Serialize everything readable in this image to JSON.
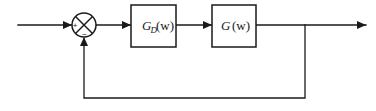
{
  "figure": {
    "type": "control-system-block-diagram",
    "width": 376,
    "height": 111,
    "background_color": "#ffffff",
    "line_color": "#1a1a1a"
  },
  "blocks": [
    {
      "id": "controller",
      "label_full": "G_D(w)",
      "label_base": "G",
      "label_subscript": "D",
      "label_arg": "(w)",
      "x": 131,
      "y": 5,
      "width": 45,
      "height": 42
    },
    {
      "id": "plant",
      "label_full": "G (w)",
      "label_base": "G",
      "label_subscript": "",
      "label_arg": "(w)",
      "x": 212,
      "y": 5,
      "width": 44,
      "height": 42
    }
  ],
  "summing_junction": {
    "id": "summer",
    "cx": 84,
    "cy": 25,
    "r": 12,
    "style": "circle-with-cross",
    "input_sign_label": "+",
    "feedback_sign_label": "−",
    "input_sign_x": 75,
    "input_sign_y": 26,
    "feedback_sign_x": 84,
    "feedback_sign_y": 36
  },
  "signals": [
    {
      "id": "reference-input",
      "from": "external-left",
      "to": "summer",
      "orientation": "horizontal",
      "x1": 18,
      "y1": 25,
      "x2": 72,
      "y2": 25,
      "arrowhead": "end"
    },
    {
      "id": "error-signal",
      "from": "summer",
      "to": "controller",
      "orientation": "horizontal",
      "x1": 96,
      "y1": 25,
      "x2": 131,
      "y2": 25,
      "arrowhead": "end"
    },
    {
      "id": "control-signal",
      "from": "controller",
      "to": "plant",
      "orientation": "horizontal",
      "x1": 176,
      "y1": 25,
      "x2": 212,
      "y2": 25,
      "arrowhead": "end"
    },
    {
      "id": "output-signal",
      "from": "plant",
      "to": "external-right",
      "orientation": "horizontal",
      "x1": 256,
      "y1": 25,
      "x2": 366,
      "y2": 25,
      "arrowhead": "end"
    }
  ],
  "feedback_path": {
    "id": "unity-feedback",
    "tap_x": 305,
    "tap_y": 25,
    "bottom_y": 98,
    "return_x": 84,
    "arrow_target_y": 38,
    "arrowhead": "end-up",
    "gain_label": ""
  },
  "icons": {
    "arrowhead": "arrowhead-icon",
    "summing-junction": "summing-junction-icon",
    "junction-tap": "junction-tap-icon"
  }
}
